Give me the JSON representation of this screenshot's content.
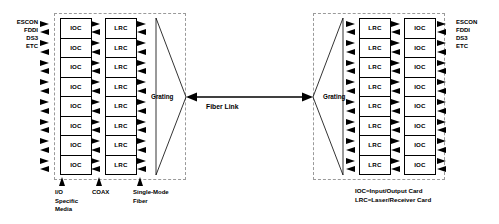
{
  "diagram": {
    "left_terminal": {
      "edge_label_lines": [
        "ESCON",
        "FDDI",
        "DS3",
        "ETC"
      ],
      "ioc_cards": [
        "IOC",
        "IOC",
        "IOC",
        "IOC",
        "IOC",
        "IOC",
        "IOC",
        "IOC"
      ],
      "lrc_cards": [
        "LRC",
        "LRC",
        "LRC",
        "LRC",
        "LRC",
        "LRC",
        "LRC",
        "LRC"
      ],
      "grating_label": "Grating"
    },
    "right_terminal": {
      "edge_label_lines": [
        "ESCON",
        "FDDI",
        "DS3",
        "ETC"
      ],
      "lrc_cards": [
        "LRC",
        "LRC",
        "LRC",
        "LRC",
        "LRC",
        "LRC",
        "LRC",
        "LRC"
      ],
      "ioc_cards": [
        "IOC",
        "IOC",
        "IOC",
        "IOC",
        "IOC",
        "IOC",
        "IOC",
        "IOC"
      ],
      "grating_label": "Grating"
    },
    "link": {
      "label": "Fiber Link"
    },
    "callouts": [
      {
        "name": "io-specific-media",
        "lines": [
          "I/O",
          "Specific",
          "Media"
        ]
      },
      {
        "name": "coax",
        "lines": [
          "COAX"
        ]
      },
      {
        "name": "single-mode-fiber",
        "lines": [
          "Single-Mode",
          "Fiber"
        ]
      }
    ],
    "legend": {
      "lines": [
        "IOC=Input/Output Card",
        "LRC=Laser/Receiver Card"
      ]
    },
    "colors": {
      "line": "#000000",
      "dashed_enclosure": "#9a9a9a",
      "background": "#ffffff"
    },
    "row_count": 8
  }
}
